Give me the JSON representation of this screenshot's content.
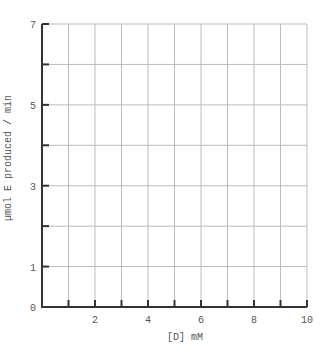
{
  "chart_data": {
    "type": "scatter",
    "title": "",
    "xlabel": "[D] mM",
    "ylabel": "µmol E produced / min",
    "xlim": [
      0,
      10
    ],
    "ylim": [
      0,
      7
    ],
    "x_ticks": [
      1,
      2,
      3,
      4,
      5,
      6,
      7,
      8,
      9,
      10
    ],
    "x_tick_labels": [
      "2",
      "4",
      "6",
      "8",
      "10"
    ],
    "x_tick_label_values": [
      2,
      4,
      6,
      8,
      10
    ],
    "y_ticks": [
      1,
      2,
      3,
      4,
      5,
      6,
      7
    ],
    "y_tick_labels": [
      "0",
      "1",
      "3",
      "5",
      "7"
    ],
    "y_tick_label_values": [
      0,
      1,
      3,
      5,
      7
    ],
    "grid": true,
    "series": [],
    "legend": null
  },
  "colors": {
    "axis": "#333333",
    "grid": "#bbbbbb",
    "text": "#555555"
  }
}
